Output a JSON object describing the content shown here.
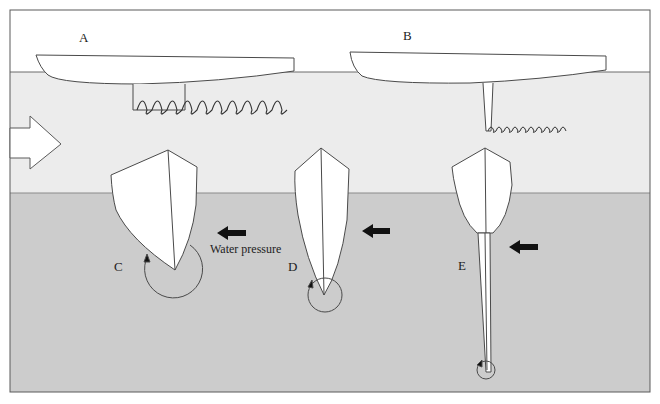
{
  "diagram": {
    "type": "keel-lateral-resistance",
    "colors": {
      "air": "#ffffff",
      "surface_water": "#ececec",
      "deep_water": "#cccccc",
      "line": "#4a4a4a",
      "hull_fill": "#ffffff",
      "arrow_fill": "#111111"
    },
    "labels": {
      "A": "A",
      "B": "B",
      "C": "C",
      "D": "D",
      "E": "E",
      "water_pressure": "Water pressure"
    },
    "panels": [
      {
        "id": "A",
        "description": "Long-keel hull profile with wide vortex trail"
      },
      {
        "id": "B",
        "description": "Fin-keel hull profile with narrow vortex trail"
      },
      {
        "id": "C",
        "description": "Wide hull section, large rotation circle"
      },
      {
        "id": "D",
        "description": "Narrow V hull section, medium rotation circle"
      },
      {
        "id": "E",
        "description": "Round hull with deep fin keel, small rotation circle"
      }
    ],
    "icons": {
      "flow_arrow": "large-right-arrow-icon",
      "pressure_arrow": "left-arrow-icon",
      "rotation": "circular-arrow-icon"
    }
  }
}
